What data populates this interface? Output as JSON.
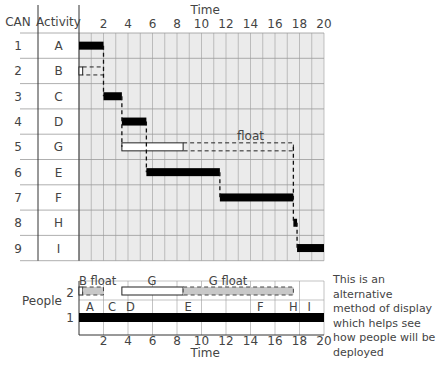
{
  "chart_data": {
    "type": "gantt",
    "title": "",
    "xlabel": "Time",
    "xlim": [
      0,
      20
    ],
    "x_ticks": [
      2,
      4,
      6,
      8,
      10,
      12,
      14,
      16,
      18,
      20
    ],
    "grid": true,
    "columns": {
      "can": "CAN",
      "activity": "Activity"
    },
    "rows": [
      {
        "can": "1",
        "activity": "A",
        "start": 0,
        "end": 2,
        "critical": true,
        "float_to": null
      },
      {
        "can": "2",
        "activity": "B",
        "start": 0,
        "end": 0.3,
        "critical": false,
        "float_to": 2
      },
      {
        "can": "3",
        "activity": "C",
        "start": 2,
        "end": 3.5,
        "critical": true,
        "float_to": null
      },
      {
        "can": "4",
        "activity": "D",
        "start": 3.5,
        "end": 5.5,
        "critical": true,
        "float_to": null
      },
      {
        "can": "5",
        "activity": "G",
        "start": 3.5,
        "end": 8.5,
        "critical": false,
        "float_to": 17.5,
        "float_label": "float"
      },
      {
        "can": "6",
        "activity": "E",
        "start": 5.5,
        "end": 11.5,
        "critical": true,
        "float_to": null
      },
      {
        "can": "7",
        "activity": "F",
        "start": 11.5,
        "end": 17.5,
        "critical": true,
        "float_to": null
      },
      {
        "can": "8",
        "activity": "H",
        "start": 17.5,
        "end": 17.8,
        "critical": true,
        "float_to": null
      },
      {
        "can": "9",
        "activity": "I",
        "start": 17.8,
        "end": 20,
        "critical": true,
        "float_to": null
      }
    ],
    "people_chart": {
      "ylabel": "People",
      "y_ticks": [
        "1",
        "2"
      ],
      "xlabel": "Time",
      "level1": {
        "start": 0,
        "end": 20,
        "labels": [
          {
            "text": "A",
            "t": 0.9
          },
          {
            "text": "C",
            "t": 2.7
          },
          {
            "text": "D",
            "t": 4.2
          },
          {
            "text": "E",
            "t": 8.9
          },
          {
            "text": "F",
            "t": 14.8
          },
          {
            "text": "H",
            "t": 17.5
          },
          {
            "text": "I",
            "t": 18.8
          }
        ]
      },
      "level2": [
        {
          "kind": "box",
          "start": 0,
          "end": 0.3
        },
        {
          "kind": "float",
          "start": 0.3,
          "end": 2,
          "label": "B float",
          "label_t": 0
        },
        {
          "kind": "box",
          "start": 3.5,
          "end": 8.5,
          "label": "G",
          "label_t": 5.6
        },
        {
          "kind": "float",
          "start": 8.5,
          "end": 17.5,
          "label": "G float",
          "label_t": 10.6
        }
      ]
    }
  },
  "note": "This is an alternative method of display which helps see how people will be deployed",
  "colors": {
    "grid_bg": "#ebebeb",
    "grid_line": "#9a9a9a",
    "bar": "#000000",
    "float_fill": "#c8c8c8"
  }
}
